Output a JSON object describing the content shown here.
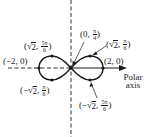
{
  "diagram": {
    "axis_label": {
      "line1": "Polar",
      "line2": "axis"
    },
    "colors": {
      "ink": "#1a1a1a",
      "background": "#ffffff"
    },
    "points": [
      {
        "id": "pole",
        "open": "(",
        "r": "0",
        "sep": ", ",
        "theta_num": "π",
        "theta_den": "4",
        "close": ")"
      },
      {
        "id": "top-right",
        "open": "(",
        "sqrt_prefix": "",
        "sqrt_arg": "2",
        "sep": ", ",
        "theta_num": "π",
        "theta_den": "6",
        "close": ")"
      },
      {
        "id": "right-vertex",
        "text": "(2, 0)"
      },
      {
        "id": "left-vertex",
        "text": "(−2, 0)"
      },
      {
        "id": "top-left",
        "open": "(",
        "sqrt_prefix": "",
        "sqrt_arg": "2",
        "sep": ", ",
        "theta_num": "5π",
        "theta_den": "6",
        "close": ")"
      },
      {
        "id": "bottom-left",
        "open": "(",
        "sqrt_prefix": "−",
        "sqrt_arg": "2",
        "sep": ", ",
        "theta_num": "π",
        "theta_den": "6",
        "close": ")"
      },
      {
        "id": "bottom-right",
        "open": "(",
        "sqrt_prefix": "−",
        "sqrt_arg": "2",
        "sep": ", ",
        "theta_num": "5π",
        "theta_den": "6",
        "close": ")"
      }
    ],
    "sqrt_symbol": "√"
  }
}
